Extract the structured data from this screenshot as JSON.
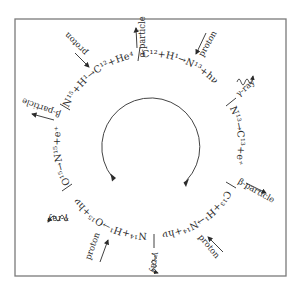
{
  "diagram": {
    "frame": {
      "x": 15,
      "y": 19,
      "width": 271,
      "height": 257,
      "stroke": "#7a7a7a"
    },
    "reactions": [
      {
        "id": "r1",
        "text": "C¹²+H¹→N¹³+hν"
      },
      {
        "id": "r2",
        "text": "N¹³→C¹³+e⁺"
      },
      {
        "id": "r3",
        "text": "C¹³+H¹→N¹⁴+hν"
      },
      {
        "id": "r4",
        "text": "N¹⁴+H¹→O¹⁵+hν"
      },
      {
        "id": "r5",
        "text": "O¹⁵→N¹⁵+e⁺"
      },
      {
        "id": "r6",
        "text": "N¹⁵+H¹→C¹²+He⁴"
      }
    ],
    "particles": [
      {
        "id": "p1",
        "label": "proton",
        "kind": "incoming",
        "near": "r1"
      },
      {
        "id": "p2",
        "label": "γ-ray",
        "kind": "outgoing-wave",
        "near": "r1"
      },
      {
        "id": "p3",
        "label": "β-particle",
        "kind": "outgoing",
        "near": "r2"
      },
      {
        "id": "p4",
        "label": "proton",
        "kind": "incoming",
        "near": "r3"
      },
      {
        "id": "p5",
        "label": "γ-ray",
        "kind": "outgoing-wave",
        "near": "r3"
      },
      {
        "id": "p6",
        "label": "proton",
        "kind": "incoming",
        "near": "r4"
      },
      {
        "id": "p7",
        "label": "γ-ray",
        "kind": "outgoing-wave",
        "near": "r4"
      },
      {
        "id": "p8",
        "label": "β-particle",
        "kind": "outgoing",
        "near": "r5"
      },
      {
        "id": "p9",
        "label": "proton",
        "kind": "incoming",
        "near": "r6"
      },
      {
        "id": "p10",
        "label": "α-particle",
        "kind": "outgoing",
        "near": "r6"
      }
    ],
    "cycle_arrow": {
      "direction": "clockwise",
      "color": "#444444"
    },
    "ink_color": "#2b2b2b"
  }
}
